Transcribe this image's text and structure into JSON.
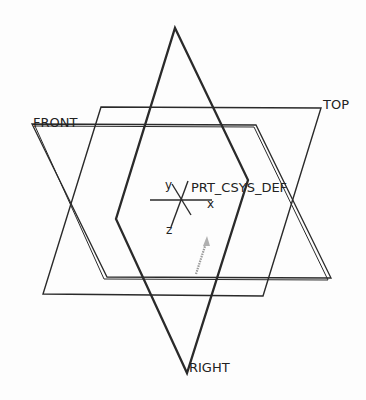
{
  "datum_planes": {
    "top": {
      "label": "TOP"
    },
    "front": {
      "label": "FRONT"
    },
    "right": {
      "label": "RIGHT"
    }
  },
  "coordinate_system": {
    "label": "PRT_CSYS_DEF",
    "axes": {
      "x": "x",
      "y": "y",
      "z": "z"
    }
  },
  "colors": {
    "line": "#2a2a2a",
    "background": "#fdfdfd",
    "arrow": "#9a9a9a"
  }
}
